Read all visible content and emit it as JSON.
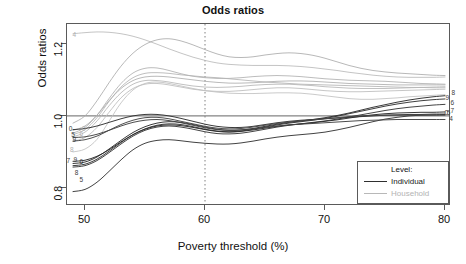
{
  "chart_data": {
    "type": "line",
    "title": "Odds ratios",
    "xlabel": "Poverty threshold (%)",
    "ylabel": "Odds ratios",
    "xlim": [
      48.5,
      80.5
    ],
    "ylim": [
      0.75,
      1.255
    ],
    "xticks": [
      50,
      60,
      70,
      80
    ],
    "yticks": [
      0.8,
      1.0,
      1.2
    ],
    "ytick_labels": [
      "0.8",
      "1.0",
      "1.2"
    ],
    "xtick_labels": [
      "50",
      "60",
      "70",
      "80"
    ],
    "grid": false,
    "reference_lines": [
      {
        "name": "odds-ratio-unity",
        "orientation": "horizontal",
        "value": 1.0,
        "style": "solid",
        "color": "#555555"
      },
      {
        "name": "poverty-threshold-60",
        "orientation": "vertical",
        "value": 60,
        "style": "dotted",
        "color": "#808080"
      }
    ],
    "legend": {
      "position": "bottom-right",
      "title": "Level:",
      "entries": [
        {
          "label": "Individual",
          "color": "#2f2f2f"
        },
        {
          "label": "Household",
          "color": "#b8b8b8"
        }
      ]
    },
    "x": [
      49,
      50,
      51,
      52,
      53,
      54,
      55,
      56,
      57,
      58,
      59,
      60,
      61,
      62,
      63,
      64,
      65,
      66,
      67,
      68,
      69,
      70,
      71,
      72,
      73,
      74,
      75,
      76,
      77,
      78,
      79,
      80
    ],
    "series": [
      {
        "name": "hh-4",
        "level": "Household",
        "label": "4",
        "color": "#b9b9b9",
        "values": [
          1.228,
          1.231,
          1.233,
          1.232,
          1.228,
          1.221,
          1.211,
          1.199,
          1.186,
          1.174,
          1.163,
          1.154,
          1.147,
          1.143,
          1.141,
          1.14,
          1.14,
          1.14,
          1.139,
          1.137,
          1.134,
          1.13,
          1.126,
          1.121,
          1.117,
          1.113,
          1.11,
          1.108,
          1.107,
          1.107,
          1.107,
          1.108
        ]
      },
      {
        "name": "hh-8",
        "level": "Household",
        "label": "8",
        "color": "#ababab",
        "values": [
          0.98,
          1.0,
          1.042,
          1.092,
          1.138,
          1.174,
          1.198,
          1.211,
          1.214,
          1.208,
          1.197,
          1.184,
          1.172,
          1.164,
          1.162,
          1.164,
          1.169,
          1.173,
          1.175,
          1.173,
          1.168,
          1.16,
          1.15,
          1.14,
          1.132,
          1.126,
          1.122,
          1.119,
          1.117,
          1.115,
          1.113,
          1.112
        ]
      },
      {
        "name": "hh-9",
        "level": "Household",
        "label": "9",
        "color": "#b0b0b0",
        "values": [
          0.952,
          0.968,
          1.002,
          1.048,
          1.09,
          1.119,
          1.132,
          1.133,
          1.126,
          1.117,
          1.11,
          1.106,
          1.104,
          1.104,
          1.106,
          1.109,
          1.111,
          1.112,
          1.111,
          1.109,
          1.106,
          1.103,
          1.101,
          1.099,
          1.098,
          1.097,
          1.096,
          1.094,
          1.092,
          1.09,
          1.089,
          1.088
        ]
      },
      {
        "name": "hh-6",
        "level": "Household",
        "label": "6",
        "color": "#b4b4b4",
        "values": [
          0.948,
          0.962,
          0.995,
          1.04,
          1.08,
          1.106,
          1.118,
          1.12,
          1.118,
          1.114,
          1.111,
          1.108,
          1.106,
          1.103,
          1.1,
          1.097,
          1.094,
          1.092,
          1.09,
          1.088,
          1.087,
          1.086,
          1.085,
          1.084,
          1.083,
          1.082,
          1.081,
          1.08,
          1.079,
          1.079,
          1.078,
          1.078
        ]
      },
      {
        "name": "hh-0",
        "level": "Household",
        "label": "0",
        "color": "#aeaeae",
        "values": [
          0.96,
          0.972,
          1.002,
          1.042,
          1.076,
          1.098,
          1.108,
          1.11,
          1.108,
          1.104,
          1.1,
          1.096,
          1.093,
          1.091,
          1.091,
          1.092,
          1.094,
          1.096,
          1.097,
          1.097,
          1.096,
          1.094,
          1.092,
          1.09,
          1.089,
          1.088,
          1.087,
          1.086,
          1.086,
          1.086,
          1.086,
          1.086
        ]
      },
      {
        "name": "hh-5",
        "level": "Household",
        "label": "5",
        "color": "#b6b6b6",
        "values": [
          0.942,
          0.955,
          0.986,
          1.028,
          1.064,
          1.088,
          1.098,
          1.098,
          1.094,
          1.088,
          1.083,
          1.08,
          1.079,
          1.08,
          1.082,
          1.085,
          1.087,
          1.088,
          1.088,
          1.086,
          1.084,
          1.081,
          1.079,
          1.077,
          1.076,
          1.076,
          1.076,
          1.077,
          1.078,
          1.079,
          1.08,
          1.081
        ]
      },
      {
        "name": "hh-7",
        "level": "Household",
        "label": "7",
        "color": "#bcbcbc",
        "values": [
          0.93,
          0.94,
          0.968,
          1.01,
          1.05,
          1.076,
          1.088,
          1.09,
          1.086,
          1.08,
          1.074,
          1.07,
          1.068,
          1.068,
          1.07,
          1.073,
          1.076,
          1.078,
          1.078,
          1.076,
          1.073,
          1.07,
          1.068,
          1.067,
          1.067,
          1.068,
          1.069,
          1.07,
          1.071,
          1.072,
          1.073,
          1.074
        ]
      },
      {
        "name": "hh-1",
        "level": "Household",
        "label": "",
        "color": "#c0c0c0",
        "values": [
          0.9,
          0.908,
          0.935,
          0.985,
          1.036,
          1.072,
          1.09,
          1.094,
          1.09,
          1.083,
          1.076,
          1.07,
          1.066,
          1.063,
          1.062,
          1.062,
          1.063,
          1.064,
          1.064,
          1.063,
          1.06,
          1.056,
          1.052,
          1.048,
          1.046,
          1.046,
          1.048,
          1.05,
          1.053,
          1.055,
          1.057,
          1.059
        ]
      },
      {
        "name": "ind-8",
        "level": "Individual",
        "label": "8",
        "color": "#2e2e2e",
        "values": [
          0.868,
          0.872,
          0.886,
          0.908,
          0.932,
          0.954,
          0.97,
          0.98,
          0.984,
          0.982,
          0.976,
          0.969,
          0.963,
          0.96,
          0.961,
          0.965,
          0.971,
          0.977,
          0.982,
          0.986,
          0.99,
          0.995,
          1.001,
          1.008,
          1.016,
          1.024,
          1.031,
          1.038,
          1.044,
          1.049,
          1.053,
          1.056
        ]
      },
      {
        "name": "ind-9",
        "level": "Individual",
        "label": "9",
        "color": "#343434",
        "values": [
          0.862,
          0.866,
          0.88,
          0.902,
          0.926,
          0.948,
          0.964,
          0.974,
          0.978,
          0.976,
          0.97,
          0.963,
          0.958,
          0.956,
          0.958,
          0.963,
          0.969,
          0.975,
          0.98,
          0.984,
          0.988,
          0.993,
          0.999,
          1.006,
          1.013,
          1.02,
          1.027,
          1.033,
          1.038,
          1.042,
          1.045,
          1.047
        ]
      },
      {
        "name": "ind-6",
        "level": "Individual",
        "label": "6",
        "color": "#3a3a3a",
        "values": [
          0.858,
          0.862,
          0.876,
          0.898,
          0.922,
          0.944,
          0.96,
          0.969,
          0.972,
          0.969,
          0.963,
          0.956,
          0.951,
          0.95,
          0.952,
          0.957,
          0.963,
          0.969,
          0.974,
          0.978,
          0.982,
          0.986,
          0.991,
          0.997,
          1.003,
          1.009,
          1.015,
          1.02,
          1.024,
          1.027,
          1.03,
          1.032
        ]
      },
      {
        "name": "ind-0",
        "level": "Individual",
        "label": "0",
        "color": "#303030",
        "values": [
          0.962,
          0.965,
          0.972,
          0.982,
          0.992,
          1.0,
          1.004,
          1.004,
          1.0,
          0.993,
          0.985,
          0.977,
          0.971,
          0.968,
          0.968,
          0.971,
          0.976,
          0.981,
          0.985,
          0.988,
          0.99,
          0.992,
          0.994,
          0.996,
          0.998,
          1.0,
          1.002,
          1.003,
          1.004,
          1.004,
          1.005,
          1.005
        ]
      },
      {
        "name": "ind-5",
        "level": "Individual",
        "label": "5",
        "color": "#383838",
        "values": [
          0.79,
          0.796,
          0.816,
          0.846,
          0.878,
          0.906,
          0.924,
          0.932,
          0.934,
          0.931,
          0.927,
          0.924,
          0.922,
          0.922,
          0.925,
          0.93,
          0.936,
          0.941,
          0.945,
          0.948,
          0.951,
          0.955,
          0.961,
          0.968,
          0.976,
          0.984,
          0.991,
          0.996,
          1.0,
          1.002,
          1.003,
          1.004
        ]
      },
      {
        "name": "ind-7",
        "level": "Individual",
        "label": "7",
        "color": "#2b2b2b",
        "values": [
          0.874,
          0.877,
          0.888,
          0.906,
          0.928,
          0.948,
          0.963,
          0.972,
          0.975,
          0.973,
          0.968,
          0.962,
          0.957,
          0.955,
          0.957,
          0.961,
          0.966,
          0.971,
          0.975,
          0.978,
          0.981,
          0.985,
          0.989,
          0.994,
          0.999,
          1.003,
          1.006,
          1.008,
          1.009,
          1.01,
          1.01,
          1.011
        ]
      },
      {
        "name": "ind-4",
        "level": "Individual",
        "label": "4",
        "color": "#424242",
        "values": [
          0.94,
          0.942,
          0.949,
          0.96,
          0.972,
          0.982,
          0.988,
          0.99,
          0.987,
          0.981,
          0.974,
          0.967,
          0.962,
          0.96,
          0.961,
          0.964,
          0.968,
          0.972,
          0.975,
          0.977,
          0.979,
          0.981,
          0.983,
          0.985,
          0.987,
          0.988,
          0.989,
          0.99,
          0.99,
          0.99,
          0.99,
          0.99
        ]
      },
      {
        "name": "ind-2",
        "level": "Individual",
        "label": "",
        "color": "#464646",
        "values": [
          0.93,
          0.934,
          0.944,
          0.96,
          0.976,
          0.988,
          0.995,
          0.996,
          0.992,
          0.985,
          0.978,
          0.971,
          0.966,
          0.964,
          0.965,
          0.969,
          0.974,
          0.979,
          0.983,
          0.986,
          0.989,
          0.992,
          0.995,
          0.998,
          1.0,
          1.001,
          1.002,
          1.002,
          1.002,
          1.002,
          1.002,
          1.002
        ]
      }
    ],
    "edge_labels": {
      "left": [
        {
          "text": "4",
          "x": 49.2,
          "y": 1.222,
          "level": "Household"
        },
        {
          "text": "0",
          "x": 48.9,
          "y": 0.962,
          "level": "Individual"
        },
        {
          "text": "0",
          "x": 50.0,
          "y": 0.962,
          "level": "Household"
        },
        {
          "text": "5",
          "x": 49.1,
          "y": 0.945,
          "level": "Individual"
        },
        {
          "text": "6",
          "x": 49.8,
          "y": 0.947,
          "level": "Household"
        },
        {
          "text": "9",
          "x": 49.2,
          "y": 0.931,
          "level": "Individual"
        },
        {
          "text": "7",
          "x": 49.9,
          "y": 0.933,
          "level": "Household"
        },
        {
          "text": "8",
          "x": 49.0,
          "y": 0.902,
          "level": "Household"
        },
        {
          "text": "7",
          "x": 48.7,
          "y": 0.872,
          "level": "Individual"
        },
        {
          "text": "9",
          "x": 49.3,
          "y": 0.876,
          "level": "Individual"
        },
        {
          "text": "6",
          "x": 49.8,
          "y": 0.87,
          "level": "Individual"
        },
        {
          "text": "8",
          "x": 49.4,
          "y": 0.84,
          "level": "Individual"
        },
        {
          "text": "5",
          "x": 49.8,
          "y": 0.818,
          "level": "Individual"
        }
      ],
      "right": [
        {
          "text": "8",
          "x": 80.8,
          "y": 1.062,
          "level": "Individual"
        },
        {
          "text": "9",
          "x": 80.3,
          "y": 1.048,
          "level": "Individual"
        },
        {
          "text": "6",
          "x": 80.7,
          "y": 1.034,
          "level": "Individual"
        },
        {
          "text": "0",
          "x": 80.2,
          "y": 1.006,
          "level": "Individual"
        },
        {
          "text": "5",
          "x": 80.4,
          "y": 1.004,
          "level": "Individual"
        },
        {
          "text": "7",
          "x": 80.7,
          "y": 1.011,
          "level": "Individual"
        },
        {
          "text": "4",
          "x": 80.6,
          "y": 0.989,
          "level": "Individual"
        }
      ]
    }
  }
}
